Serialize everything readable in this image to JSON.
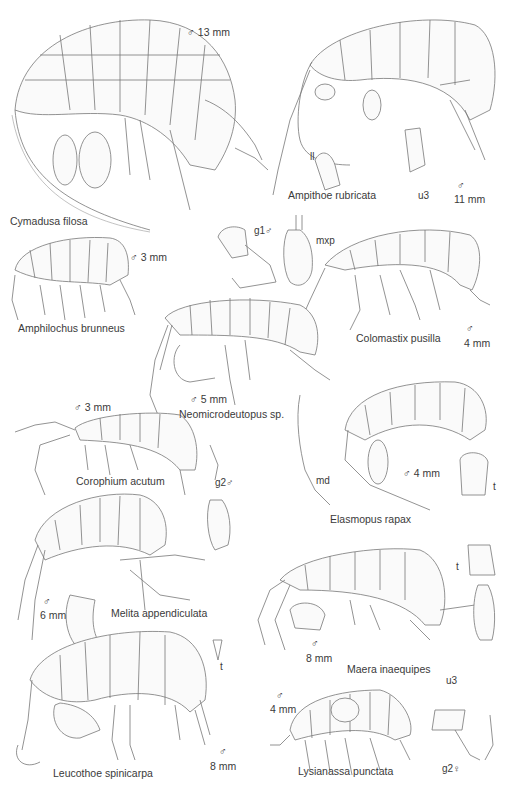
{
  "plate": {
    "title": "Amphipoda illustration plate",
    "specimens": [
      {
        "name": "Cymadusa filosa",
        "sex": "♂",
        "size": "13 mm"
      },
      {
        "name": "Ampithoe rubricata",
        "sex": "♂",
        "size": "11 mm",
        "details": [
          "ll",
          "u3"
        ]
      },
      {
        "name": "Amphilochus brunneus",
        "sex": "♂",
        "size": "3 mm"
      },
      {
        "name": "Colomastix pusilla",
        "sex": "♂",
        "size": "4 mm",
        "details": [
          "g1 ♂",
          "mxp"
        ]
      },
      {
        "name": "Neomicrodeutopus sp.",
        "sex": "♂",
        "size": "5 mm"
      },
      {
        "name": "Corophium acutum",
        "sex": "♂",
        "size": "3 mm",
        "details": [
          "g2 ♂"
        ]
      },
      {
        "name": "Elasmopus rapax",
        "sex": "♂",
        "size": "4 mm",
        "details": [
          "md",
          "t"
        ]
      },
      {
        "name": "Melita appendiculata",
        "sex": "♂",
        "size": "6 mm"
      },
      {
        "name": "Maera inaequipes",
        "sex": "♂",
        "size": "8 mm",
        "details": [
          "t",
          "u3"
        ]
      },
      {
        "name": "Leucothoe spinicarpa",
        "sex": "♂",
        "size": "8 mm",
        "details": [
          "t"
        ]
      },
      {
        "name": "Lysianassa punctata",
        "sex": "♂",
        "size": "4 mm",
        "details": [
          "g2 ♀"
        ]
      }
    ]
  },
  "labels": {
    "cymadusa_name": "Cymadusa filosa",
    "cymadusa_size": "♂  13 mm",
    "ampithoe_name": "Ampithoe rubricata",
    "ampithoe_sex": "♂",
    "ampithoe_size": "11 mm",
    "ampithoe_ll": "ll",
    "ampithoe_u3": "u3",
    "amphilochus_name": "Amphilochus brunneus",
    "amphilochus_size": "♂  3 mm",
    "colomastix_name": "Colomastix pusilla",
    "colomastix_sex": "♂",
    "colomastix_size": "4 mm",
    "g1": "g1♂",
    "mxp": "mxp",
    "neomicro_name": "Neomicrodeutopus sp.",
    "neomicro_size": "♂  5 mm",
    "corophium_name": "Corophium acutum",
    "corophium_size": "♂  3 mm",
    "corophium_g2": "g2♂",
    "elasmopus_name": "Elasmopus rapax",
    "elasmopus_size": "♂  4 mm",
    "elasmopus_md": "md",
    "elasmopus_t": "t",
    "melita_name": "Melita appendiculata",
    "melita_sex": "♂",
    "melita_size": "6 mm",
    "maera_name": "Maera inaequipes",
    "maera_sex": "♂",
    "maera_size": "8 mm",
    "maera_t": "t",
    "maera_u3": "u3",
    "leucothoe_name": "Leucothoe spinicarpa",
    "leucothoe_sex": "♂",
    "leucothoe_size": "8 mm",
    "leucothoe_t": "t",
    "lysianassa_name": "Lysianassa punctata",
    "lysianassa_sex": "♂",
    "lysianassa_size": "4 mm",
    "lysianassa_g2": "g2♀"
  }
}
